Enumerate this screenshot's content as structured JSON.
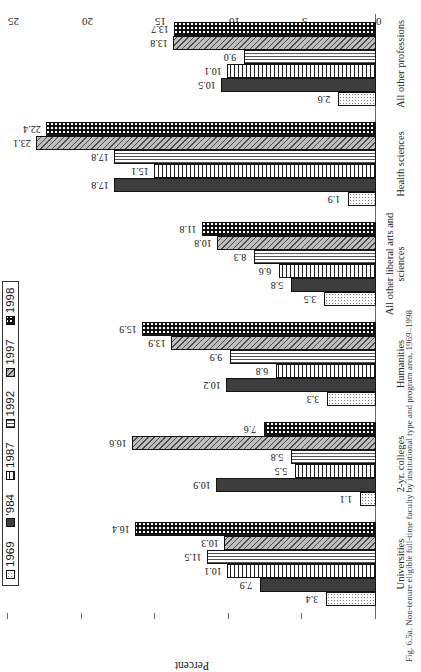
{
  "figure": {
    "caption": "Fig. 6.5a. Non-tenure eligible full-time faculty by institutional type and program area, 1969–1998"
  },
  "chart_data": {
    "type": "bar",
    "title": "",
    "xlabel": "",
    "ylabel": "Percent",
    "ylim": [
      0,
      25
    ],
    "yticks": [
      "0",
      "5",
      "10",
      "15",
      "20",
      "25"
    ],
    "grid": false,
    "legend_position": "top-left",
    "orientation": "vertical-grouped",
    "categories": [
      "Universities",
      "2-yr. colleges",
      "Humanities",
      "All other liberal arts and sciences",
      "Health sciences",
      "All other professions"
    ],
    "series": [
      {
        "name": "1969",
        "values": [
          3.4,
          1.1,
          3.3,
          3.5,
          1.9,
          2.6
        ]
      },
      {
        "name": "'984",
        "values": [
          7.9,
          10.9,
          10.2,
          5.8,
          17.8,
          10.5
        ]
      },
      {
        "name": "1987",
        "values": [
          10.1,
          5.5,
          6.8,
          6.6,
          15.1,
          10.1
        ]
      },
      {
        "name": "1992",
        "values": [
          11.5,
          5.8,
          9.9,
          8.3,
          17.8,
          9.0
        ]
      },
      {
        "name": "1997",
        "values": [
          10.3,
          16.6,
          13.9,
          10.8,
          23.1,
          13.8
        ]
      },
      {
        "name": "1998",
        "values": [
          16.4,
          7.6,
          15.9,
          11.8,
          22.4,
          13.7
        ]
      }
    ]
  },
  "legend": {
    "items": [
      {
        "label": "1969"
      },
      {
        "label": "'984"
      },
      {
        "label": "1987"
      },
      {
        "label": "1992"
      },
      {
        "label": "1997"
      },
      {
        "label": "1998"
      }
    ]
  }
}
